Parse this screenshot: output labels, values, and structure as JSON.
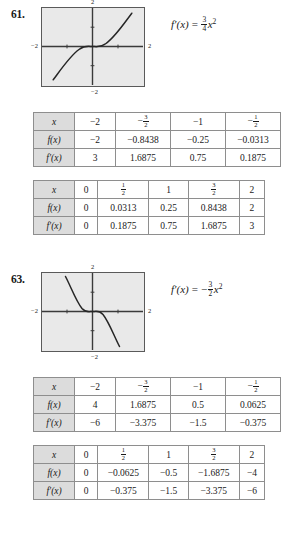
{
  "problems": [
    {
      "number": "61.",
      "formula": {
        "lhs": "f′(x)",
        "equals": "=",
        "sign": "",
        "frac_num": "3",
        "frac_den": "4",
        "variable": "x",
        "exponent": "2"
      },
      "graph": {
        "top_label": "2",
        "bottom_label": "−2",
        "left_label": "−2",
        "right_label": "2",
        "description": "cubic-increasing-curve",
        "xmin": -2,
        "xmax": 2,
        "ymin": -2,
        "ymax": 2,
        "curve": "y = x^3/4"
      },
      "table1": {
        "rows": [
          {
            "label": "x",
            "cells": [
              "−2",
              "-3/2",
              "−1",
              "-1/2"
            ]
          },
          {
            "label": "f(x)",
            "cells": [
              "−2",
              "−0.8438",
              "−0.25",
              "−0.0313"
            ]
          },
          {
            "label": "f′(x)",
            "cells": [
              "3",
              "1.6875",
              "0.75",
              "0.1875"
            ]
          }
        ]
      },
      "table2": {
        "rows": [
          {
            "label": "x",
            "cells": [
              "0",
              "1/2",
              "1",
              "3/2",
              "2"
            ]
          },
          {
            "label": "f(x)",
            "cells": [
              "0",
              "0.0313",
              "0.25",
              "0.8438",
              "2"
            ]
          },
          {
            "label": "f′(x)",
            "cells": [
              "0",
              "0.1875",
              "0.75",
              "1.6875",
              "3"
            ]
          }
        ]
      }
    },
    {
      "number": "63.",
      "formula": {
        "lhs": "f′(x)",
        "equals": "=",
        "sign": "−",
        "frac_num": "3",
        "frac_den": "2",
        "variable": "x",
        "exponent": "2"
      },
      "graph": {
        "top_label": "2",
        "bottom_label": "−2",
        "left_label": "−2",
        "right_label": "2",
        "description": "cubic-decreasing-curve",
        "xmin": -2,
        "xmax": 2,
        "ymin": -2,
        "ymax": 2,
        "curve": "y = -x^3/2"
      },
      "table1": {
        "rows": [
          {
            "label": "x",
            "cells": [
              "−2",
              "-3/2",
              "−1",
              "-1/2"
            ]
          },
          {
            "label": "f(x)",
            "cells": [
              "4",
              "1.6875",
              "0.5",
              "0.0625"
            ]
          },
          {
            "label": "f′(x)",
            "cells": [
              "−6",
              "−3.375",
              "−1.5",
              "−0.375"
            ]
          }
        ]
      },
      "table2": {
        "rows": [
          {
            "label": "x",
            "cells": [
              "0",
              "1/2",
              "1",
              "3/2",
              "2"
            ]
          },
          {
            "label": "f(x)",
            "cells": [
              "0",
              "−0.0625",
              "−0.5",
              "−1.6875",
              "−4"
            ]
          },
          {
            "label": "f′(x)",
            "cells": [
              "0",
              "−0.375",
              "−1.5",
              "−3.375",
              "−6"
            ]
          }
        ]
      }
    }
  ]
}
